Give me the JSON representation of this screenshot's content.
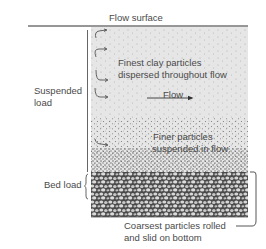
{
  "diagram": {
    "flow_surface_label": "Flow surface",
    "suspended_load_label_line1": "Suspended",
    "suspended_load_label_line2": "load",
    "bed_load_label": "Bed load",
    "finest_label_line1": "Finest clay particles",
    "finest_label_line2": "dispersed throughout flow",
    "flow_label": "Flow",
    "finer_label_line1": "Finer particles",
    "finer_label_line2": "suspended in flow",
    "coarsest_label_line1": "Coarsest particles rolled",
    "coarsest_label_line2": "and slid on bottom",
    "colors": {
      "water": "#e4e4e4",
      "stipple": "#6a6a6a",
      "bed": "#5a5a5a",
      "line": "#2e2e2e"
    }
  }
}
